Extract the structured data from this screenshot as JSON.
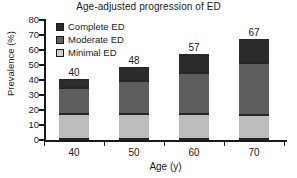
{
  "chart_data": {
    "type": "bar",
    "stacked": true,
    "title": "Age-adjusted progression of ED",
    "xlabel": "Age (y)",
    "ylabel": "Prevalence (%)",
    "categories": [
      "40",
      "50",
      "60",
      "70"
    ],
    "ylim": [
      0,
      80
    ],
    "yticks": [
      "0",
      "10",
      "20",
      "30",
      "40",
      "50",
      "60",
      "70",
      "80"
    ],
    "grid": false,
    "legend_position": "top-left",
    "series": [
      {
        "name": "Minimal ED",
        "color": "#bdbdbd",
        "values": [
          17,
          17,
          17,
          16
        ]
      },
      {
        "name": "Moderate ED",
        "color": "#5e5e5e",
        "values": [
          17,
          22,
          27,
          35
        ]
      },
      {
        "name": "Complete ED",
        "color": "#2b2b2b",
        "values": [
          6,
          9,
          13,
          16
        ]
      }
    ],
    "totals": [
      "40",
      "48",
      "57",
      "67"
    ],
    "annotations": [
      {
        "text": "40",
        "category": "40"
      },
      {
        "text": "48",
        "category": "50"
      },
      {
        "text": "57",
        "category": "60"
      },
      {
        "text": "67",
        "category": "70"
      }
    ]
  },
  "legend": {
    "items": [
      {
        "label": "Complete ED",
        "swatch": "complete"
      },
      {
        "label": "Moderate ED",
        "swatch": "moderate"
      },
      {
        "label": "Minimal ED",
        "swatch": "minimal"
      }
    ]
  },
  "colors": {
    "complete": "#2b2b2b",
    "moderate": "#5e5e5e",
    "minimal": "#bdbdbd",
    "axis": "#1a1a1a",
    "background": "#ffffff"
  }
}
